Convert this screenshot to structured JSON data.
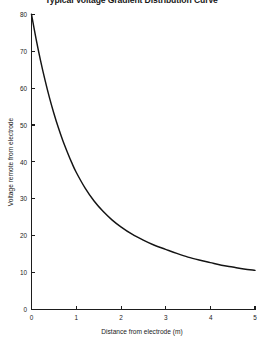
{
  "chart_data": {
    "type": "line",
    "title": "Typical Voltage Gradient Distribution Curve",
    "xlabel": "Distance from electrode (m)",
    "ylabel": "Voltage remote from electrode",
    "xlim": [
      0,
      5
    ],
    "ylim": [
      0,
      80
    ],
    "xticks": [
      "0",
      "1",
      "2",
      "3",
      "4",
      "5"
    ],
    "yticks": [
      "0",
      "10",
      "20",
      "30",
      "40",
      "50",
      "60",
      "70",
      "80"
    ],
    "grid": false,
    "legend": false,
    "series": [
      {
        "name": "Voltage gradient",
        "x": [
          0.0,
          0.1,
          0.2,
          0.3,
          0.4,
          0.5,
          0.6,
          0.7,
          0.8,
          0.9,
          1.0,
          1.2,
          1.4,
          1.6,
          1.8,
          2.0,
          2.25,
          2.5,
          2.75,
          3.0,
          3.25,
          3.5,
          3.75,
          4.0,
          4.25,
          4.5,
          4.75,
          5.0
        ],
        "values": [
          80.0,
          73.5,
          67.6,
          62.3,
          57.5,
          53.2,
          49.3,
          45.8,
          42.7,
          39.8,
          37.2,
          32.9,
          29.4,
          26.6,
          24.3,
          22.4,
          20.4,
          18.8,
          17.4,
          16.3,
          15.2,
          14.2,
          13.4,
          12.7,
          12.0,
          11.5,
          11.0,
          10.6
        ]
      }
    ],
    "stroke_color": "#141414",
    "axis_color": "#1d1d1d",
    "background_color": "#ffffff"
  }
}
